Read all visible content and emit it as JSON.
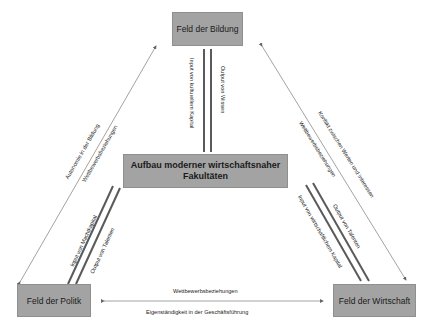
{
  "diagram": {
    "nodes": {
      "bildung": "Feld der Bildung",
      "center": "Aufbau moderner wirtschaftsnaher Fakultäten",
      "center_line1": "Aufbau moderner wirtschaftsnaher",
      "center_line2": "Fakultäten",
      "politik": "Feld der Politk",
      "wirtschaft": "Feld der Wirtschaft"
    },
    "edges": {
      "bildung_center_input": "Input von kulturellem Kapital",
      "bildung_center_output": "Output von Wissen",
      "politik_bildung_outer": "Autonomie in der Bildung",
      "politik_bildung_inner": "Wettbewerbsbeziehungen",
      "politik_center_input": "Input von Machtkapital",
      "politik_center_output": "Output von Talenten",
      "wirtschaft_bildung_outer": "Konflikt zwischen Werten und Interessen",
      "wirtschaft_bildung_inner": "Wettbewerbsbeziehungen",
      "wirtschaft_center_input": "Input von wirtschaftlichem Kapital",
      "wirtschaft_center_output": "Output von Talenten",
      "politik_wirtschaft_top": "Wettbewerbsbeziehungen",
      "politik_wirtschaft_bottom": "Eigenständigkeit in der Geschäftsführung"
    },
    "colors": {
      "box_fill": "#a3a3a3",
      "thick_line": "#5a5a5a",
      "thin_line": "#8a8a8a"
    }
  }
}
